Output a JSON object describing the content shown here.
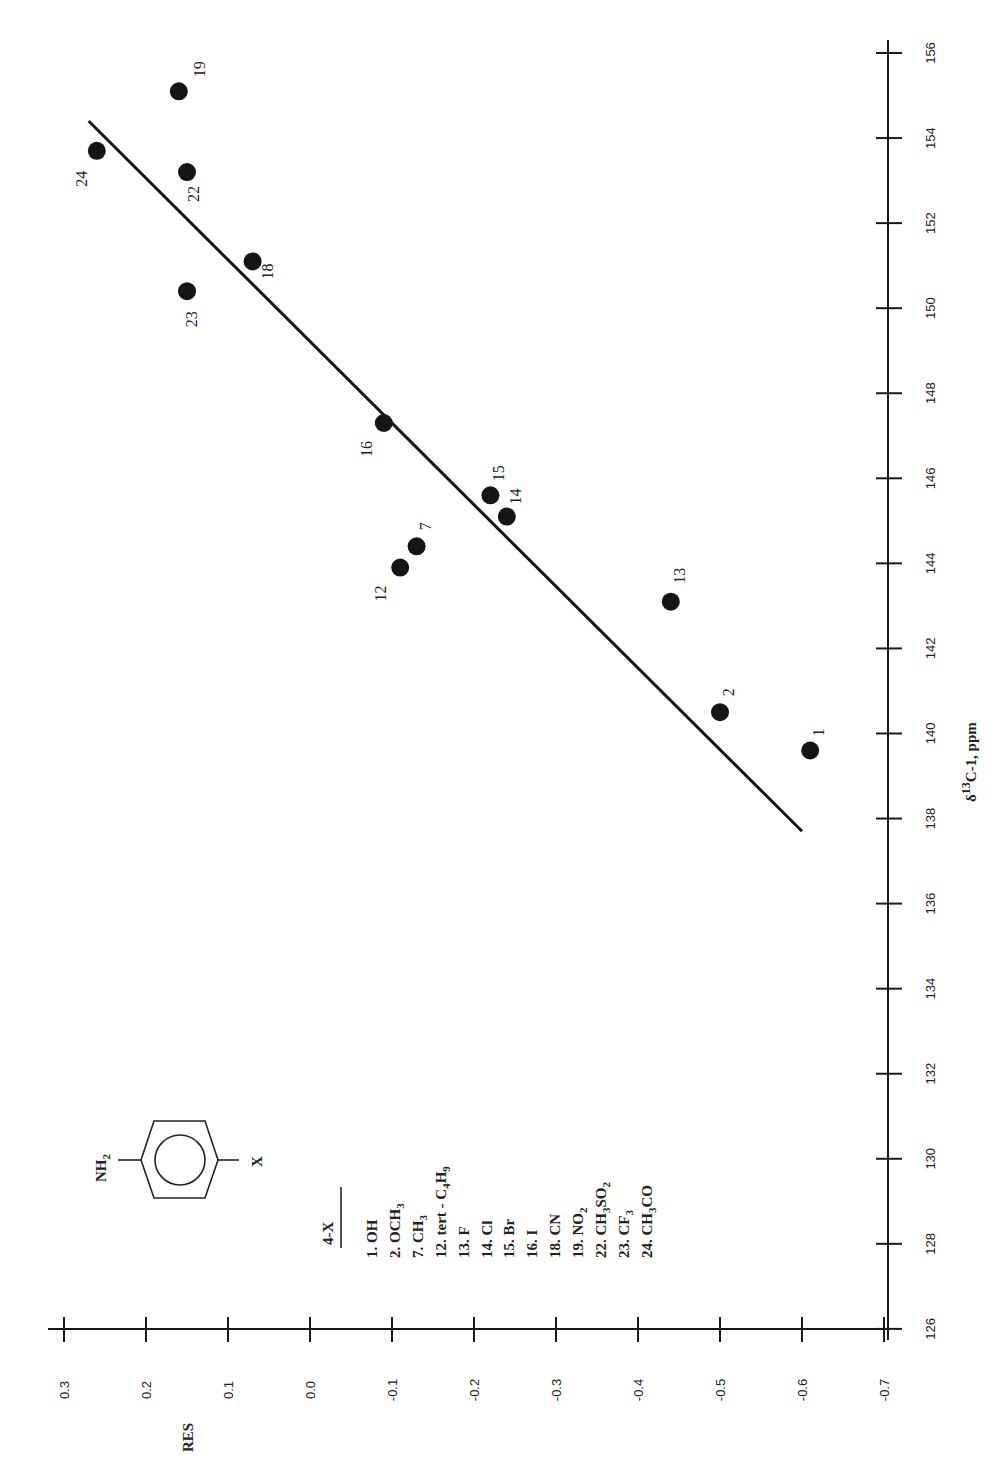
{
  "chart_data": {
    "type": "scatter",
    "orientation": "rotated-90-ccw",
    "title": "",
    "xlabel": "δ13C-1, ppm",
    "xlabel_parts": {
      "delta": "δ",
      "superscript": "13",
      "rest": "C-1, ppm"
    },
    "ylabel": "RES",
    "xlim": [
      126,
      156
    ],
    "ylim": [
      -0.7,
      0.3
    ],
    "x_ticks": [
      126,
      128,
      130,
      132,
      134,
      136,
      138,
      140,
      142,
      144,
      146,
      148,
      150,
      152,
      154,
      156
    ],
    "y_ticks": [
      0.3,
      0.2,
      0.1,
      0.0,
      -0.1,
      -0.2,
      -0.3,
      -0.4,
      -0.5,
      -0.6,
      -0.7
    ],
    "y_tick_labels": [
      "0.3",
      "0.2",
      "0.1",
      "0.0",
      "-0.1",
      "-0.2",
      "-0.3",
      "-0.4",
      "-0.5",
      "-0.6",
      "-0.7"
    ],
    "grid": false,
    "points": [
      {
        "id": "1",
        "x": 139.6,
        "y": -0.61,
        "label_dx": 14,
        "label_dy": -18
      },
      {
        "id": "2",
        "x": 140.5,
        "y": -0.5,
        "label_dx": 14,
        "label_dy": -20
      },
      {
        "id": "7",
        "x": 144.4,
        "y": -0.13,
        "label_dx": 14,
        "label_dy": -20
      },
      {
        "id": "12",
        "x": 143.9,
        "y": -0.11,
        "label_dx": -14,
        "label_dy": 26
      },
      {
        "id": "13",
        "x": 143.1,
        "y": -0.44,
        "label_dx": 14,
        "label_dy": -26
      },
      {
        "id": "14",
        "x": 145.1,
        "y": -0.24,
        "label_dx": 14,
        "label_dy": -20
      },
      {
        "id": "15",
        "x": 145.6,
        "y": -0.22,
        "label_dx": 14,
        "label_dy": -22
      },
      {
        "id": "16",
        "x": 147.3,
        "y": -0.09,
        "label_dx": -12,
        "label_dy": 26
      },
      {
        "id": "18",
        "x": 151.1,
        "y": 0.07,
        "label_dx": 20,
        "label_dy": 10
      },
      {
        "id": "19",
        "x": 155.1,
        "y": 0.16,
        "label_dx": 26,
        "label_dy": -22
      },
      {
        "id": "22",
        "x": 153.2,
        "y": 0.15,
        "label_dx": 12,
        "label_dy": 22
      },
      {
        "id": "23",
        "x": 150.4,
        "y": 0.15,
        "label_dx": 10,
        "label_dy": 28
      },
      {
        "id": "24",
        "x": 153.7,
        "y": 0.26,
        "label_dx": -10,
        "label_dy": 28
      }
    ],
    "regression_line": {
      "x": [
        137.7,
        154.4
      ],
      "y": [
        -0.6,
        0.27
      ]
    },
    "legend": {
      "structure_label": "NH2-C6H4-X",
      "structure_left": "NH",
      "structure_left_sub": "2",
      "structure_right": "X",
      "header": "4-X",
      "entries": [
        {
          "n": "1.",
          "main": "OH",
          "sub": "",
          "tail": "",
          "sub2": ""
        },
        {
          "n": "2.",
          "main": "OCH",
          "sub": "3",
          "tail": "",
          "sub2": ""
        },
        {
          "n": "7.",
          "main": "CH",
          "sub": "3",
          "tail": "",
          "sub2": ""
        },
        {
          "n": "12.",
          "main": "tert - C",
          "sub": "4",
          "tail": "H",
          "sub2": "9"
        },
        {
          "n": "13.",
          "main": "F",
          "sub": "",
          "tail": "",
          "sub2": ""
        },
        {
          "n": "14.",
          "main": "Cl",
          "sub": "",
          "tail": "",
          "sub2": ""
        },
        {
          "n": "15.",
          "main": "Br",
          "sub": "",
          "tail": "",
          "sub2": ""
        },
        {
          "n": "16.",
          "main": "I",
          "sub": "",
          "tail": "",
          "sub2": ""
        },
        {
          "n": "18.",
          "main": "CN",
          "sub": "",
          "tail": "",
          "sub2": ""
        },
        {
          "n": "19.",
          "main": "NO",
          "sub": "2",
          "tail": "",
          "sub2": ""
        },
        {
          "n": "22.",
          "main": "CH",
          "sub": "3",
          "tail": "SO",
          "sub2": "2"
        },
        {
          "n": "23.",
          "main": "CF",
          "sub": "3",
          "tail": "",
          "sub2": ""
        },
        {
          "n": "24.",
          "main": "CH",
          "sub": "3",
          "tail": "CO",
          "sub2": ""
        }
      ]
    }
  },
  "colors": {
    "ink": "#151515",
    "background": "#ffffff"
  }
}
